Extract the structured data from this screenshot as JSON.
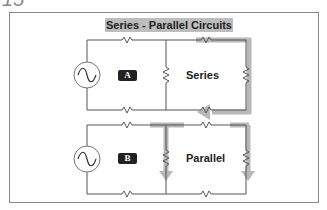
{
  "corner_number": "15",
  "title": "Series - Parallel Circuits",
  "circuits": [
    {
      "badge": "A",
      "label": "Series",
      "source": "ac-source"
    },
    {
      "badge": "B",
      "label": "Parallel",
      "source": "ac-source"
    }
  ],
  "colors": {
    "wire": "#555555",
    "highlight": "#b3b3b3",
    "badge_bg": "#222222",
    "title_bg": "#bdbdbd"
  }
}
